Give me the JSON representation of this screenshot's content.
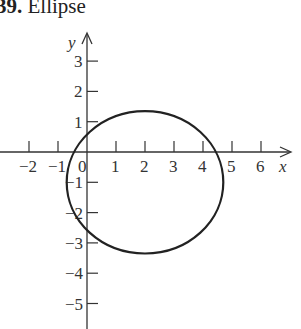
{
  "title": {
    "number": "39.",
    "text": "Ellipse"
  },
  "chart_data": {
    "type": "line",
    "title": "39. Ellipse",
    "xlabel": "x",
    "ylabel": "y",
    "x_ticks": [
      -2,
      -1,
      0,
      1,
      2,
      3,
      4,
      5,
      6
    ],
    "y_ticks": [
      3,
      2,
      1,
      -1,
      -2,
      -3,
      -4,
      -5
    ],
    "x_tick_labels": [
      "−2",
      "−1",
      "0",
      "1",
      "2",
      "3",
      "4",
      "5",
      "6"
    ],
    "y_tick_labels": [
      "3",
      "2",
      "1",
      "−1",
      "−2",
      "−3",
      "−4",
      "−5"
    ],
    "xlim": [
      -3,
      7
    ],
    "ylim": [
      -6,
      4
    ],
    "grid": false,
    "series": [
      {
        "name": "ellipse",
        "shape": "ellipse",
        "center": [
          2,
          -1
        ],
        "semi_axis_x": 2.7,
        "semi_axis_y": 2.35
      }
    ]
  },
  "colors": {
    "stroke": "#222222",
    "axis": "#333333"
  }
}
